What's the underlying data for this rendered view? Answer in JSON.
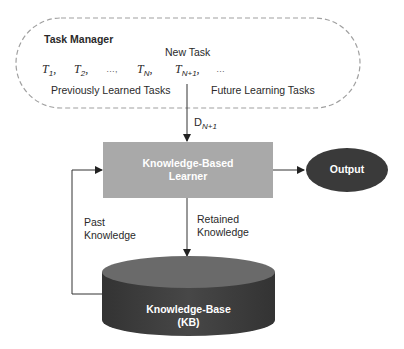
{
  "task_manager": {
    "title": "Task Manager",
    "new_task_label": "New Task",
    "tasks": [
      {
        "base": "T",
        "sub": "1",
        "suffix": ","
      },
      {
        "base": "T",
        "sub": "2",
        "suffix": ","
      },
      {
        "base": "…",
        "sub": "",
        "suffix": ","
      },
      {
        "base": "T",
        "sub": "N",
        "suffix": ","
      },
      {
        "base": "T",
        "sub": "N+1",
        "suffix": ","
      },
      {
        "base": "…",
        "sub": "",
        "suffix": ""
      }
    ],
    "previous_label": "Previously Learned Tasks",
    "future_label": "Future Learning Tasks"
  },
  "edges": {
    "data_label_base": "D",
    "data_label_sub": "N+1",
    "past_knowledge": [
      "Past",
      "Knowledge"
    ],
    "retained_knowledge": [
      "Retained",
      "Knowledge"
    ]
  },
  "learner": {
    "label_line1": "Knowledge-Based",
    "label_line2": "Learner"
  },
  "output": {
    "label": "Output"
  },
  "kb": {
    "label_line1": "Knowledge-Base",
    "label_line2": "(KB)"
  },
  "colors": {
    "learner_fill": "#a9a9a9",
    "output_fill": "#3a3a3a",
    "kb_side": "#3d3d3d",
    "kb_top": "#6a6a6a",
    "dashed_border": "#a0a0a0",
    "line": "#333333"
  }
}
